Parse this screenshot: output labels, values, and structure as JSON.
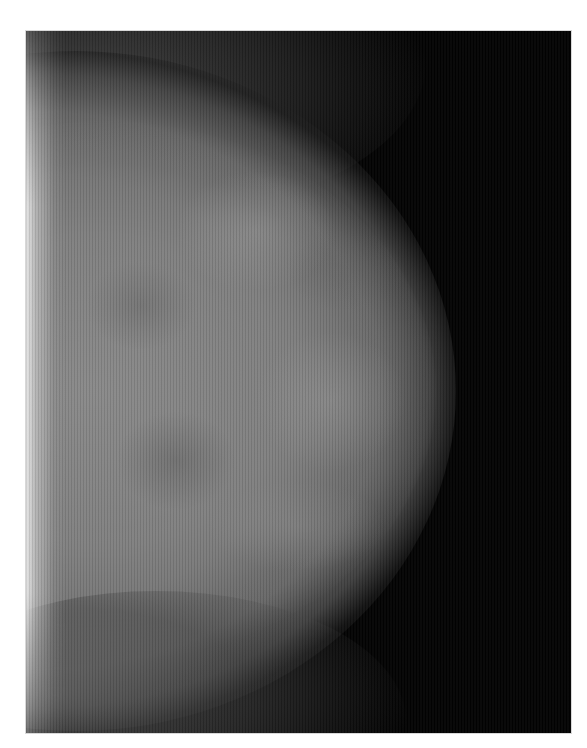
{
  "image": {
    "subject": "grayscale mammogram",
    "background_color": "#ffffff",
    "film_color": "#020202",
    "tissue_color": "#7a7a7a",
    "skin_edge_color": "#e6e6e6"
  }
}
